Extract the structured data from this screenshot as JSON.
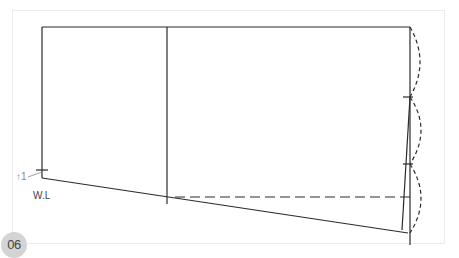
{
  "figure": {
    "step_number": "06",
    "labels": {
      "waist_line": "W.L",
      "up_marker": "↑1"
    },
    "caption": "",
    "colors": {
      "line": "#2a2a2a",
      "frame": "#ececec",
      "badge_bg": "#d4d4d4",
      "badge_text": "#444444"
    }
  }
}
